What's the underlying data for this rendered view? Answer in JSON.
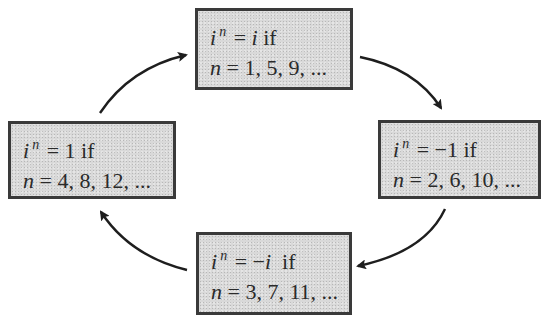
{
  "diagram": {
    "nodes": [
      {
        "id": "top",
        "base": "i",
        "exponent": "n",
        "equals": "=",
        "value": "i",
        "value_italic": true,
        "condition": "if",
        "n_label": "n",
        "n_values": "= 1, 5, 9, ..."
      },
      {
        "id": "right",
        "base": "i",
        "exponent": "n",
        "equals": "=",
        "value": "−1",
        "value_italic": false,
        "condition": "if",
        "n_label": "n",
        "n_values": "= 2, 6, 10, ..."
      },
      {
        "id": "bottom",
        "base": "i",
        "exponent": "n",
        "equals": "=",
        "value_sign": "−",
        "value": "i",
        "value_italic": true,
        "condition": "if",
        "n_label": "n",
        "n_values": "= 3, 7, 11, ..."
      },
      {
        "id": "left",
        "base": "i",
        "exponent": "n",
        "equals": "=",
        "value": "1",
        "value_italic": false,
        "condition": "if",
        "n_label": "n",
        "n_values": "= 4, 8, 12, ..."
      }
    ],
    "edges": [
      {
        "from": "top",
        "to": "right",
        "direction": "clockwise"
      },
      {
        "from": "right",
        "to": "bottom",
        "direction": "clockwise"
      },
      {
        "from": "bottom",
        "to": "left",
        "direction": "clockwise"
      },
      {
        "from": "left",
        "to": "top",
        "direction": "clockwise"
      }
    ],
    "colors": {
      "box_fill": "#d9d9d9",
      "box_border": "#3a3a3a",
      "text": "#2a2a2a",
      "arrow": "#1e1e1e",
      "background": "#ffffff"
    }
  }
}
